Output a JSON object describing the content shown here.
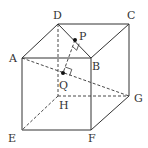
{
  "diagram": {
    "type": "cube-geometry",
    "vertices": {
      "A": {
        "label": "A",
        "x": 22,
        "y": 58
      },
      "B": {
        "label": "B",
        "x": 91,
        "y": 58
      },
      "C": {
        "label": "C",
        "x": 129,
        "y": 24
      },
      "D": {
        "label": "D",
        "x": 58,
        "y": 24
      },
      "E": {
        "label": "E",
        "x": 22,
        "y": 130
      },
      "F": {
        "label": "F",
        "x": 91,
        "y": 130
      },
      "G": {
        "label": "G",
        "x": 129,
        "y": 96
      },
      "H": {
        "label": "H",
        "x": 58,
        "y": 96
      }
    },
    "points": {
      "P": {
        "label": "P",
        "x": 75,
        "y": 40,
        "on": "DB"
      },
      "Q": {
        "label": "Q",
        "x": 63,
        "y": 73,
        "on": "AG"
      }
    },
    "solid_edges": [
      "AB",
      "BC",
      "CD",
      "DA",
      "AE",
      "BF",
      "CG",
      "EF",
      "FG",
      "DB"
    ],
    "dashed_edges": [
      "DH",
      "HE",
      "HG",
      "AG",
      "PQ"
    ],
    "right_angles": [
      "at P between PQ and DB",
      "at Q between PQ and AG"
    ],
    "colors": {
      "stroke": "#333333",
      "background": "#ffffff"
    }
  }
}
